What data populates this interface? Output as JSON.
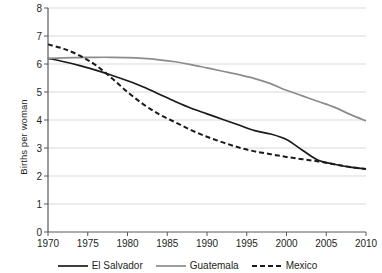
{
  "chart_data": {
    "type": "line",
    "title": "",
    "xlabel": "",
    "ylabel": "Births per woman",
    "xlim": [
      1970,
      2010
    ],
    "ylim": [
      0,
      8
    ],
    "grid": true,
    "legend_position": "bottom",
    "xticks": [
      "1970",
      "1975",
      "1980",
      "1985",
      "1990",
      "1995",
      "2000",
      "2005",
      "2010"
    ],
    "yticks": [
      "0",
      "1",
      "2",
      "3",
      "4",
      "5",
      "6",
      "7",
      "8"
    ],
    "x": [
      1970,
      1972,
      1974,
      1976,
      1978,
      1980,
      1982,
      1984,
      1986,
      1988,
      1990,
      1992,
      1994,
      1996,
      1998,
      2000,
      2002,
      2004,
      2006,
      2008,
      2010
    ],
    "series": [
      {
        "name": "El Salvador",
        "color": "#1a1a1a",
        "style": "solid",
        "values": [
          6.2,
          6.08,
          5.94,
          5.78,
          5.6,
          5.4,
          5.18,
          4.92,
          4.66,
          4.42,
          4.22,
          4.02,
          3.82,
          3.62,
          3.5,
          3.3,
          2.92,
          2.56,
          2.42,
          2.32,
          2.25
        ]
      },
      {
        "name": "Guatemala",
        "color": "#8c8c8c",
        "style": "solid",
        "values": [
          6.2,
          6.22,
          6.23,
          6.24,
          6.24,
          6.23,
          6.2,
          6.15,
          6.08,
          5.98,
          5.86,
          5.74,
          5.62,
          5.48,
          5.3,
          5.06,
          4.86,
          4.66,
          4.46,
          4.2,
          3.97
        ]
      },
      {
        "name": "Mexico",
        "color": "#1a1a1a",
        "style": "dashed",
        "values": [
          6.7,
          6.54,
          6.3,
          5.96,
          5.5,
          5.0,
          4.56,
          4.2,
          3.92,
          3.64,
          3.4,
          3.2,
          3.02,
          2.88,
          2.78,
          2.68,
          2.6,
          2.52,
          2.42,
          2.32,
          2.25
        ]
      }
    ],
    "legend": [
      {
        "label": "El Salvador",
        "color": "#1a1a1a",
        "style": "solid"
      },
      {
        "label": "Guatemala",
        "color": "#8c8c8c",
        "style": "solid"
      },
      {
        "label": "Mexico",
        "color": "#1a1a1a",
        "style": "dashed"
      }
    ]
  }
}
